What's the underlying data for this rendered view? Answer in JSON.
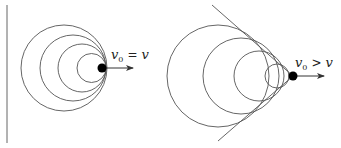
{
  "figure": {
    "left_panel": {
      "label": {
        "symbol": "v",
        "subscript": "0",
        "operator": "=",
        "rhs": "v"
      },
      "wall_line": {
        "x": 7,
        "y1": 5,
        "y2": 143
      },
      "source": {
        "cx": 102,
        "cy": 68,
        "r": 4.5
      },
      "velocity_arrow": {
        "x1": 106,
        "y1": 68,
        "x2": 133,
        "y2": 68
      },
      "wavefronts": [
        {
          "cx": 64,
          "cy": 68,
          "r": 43
        },
        {
          "cx": 73,
          "cy": 68,
          "r": 33
        },
        {
          "cx": 82,
          "cy": 68,
          "r": 24
        },
        {
          "cx": 91.5,
          "cy": 68,
          "r": 14.5
        }
      ]
    },
    "right_panel": {
      "label": {
        "symbol": "v",
        "subscript": "0",
        "operator": ">",
        "rhs": "v"
      },
      "source": {
        "cx": 293,
        "cy": 76,
        "r": 4.5
      },
      "velocity_arrow": {
        "x1": 297,
        "y1": 76,
        "x2": 324,
        "y2": 76
      },
      "mach_cone": {
        "upper": {
          "x1": 212,
          "y1": 5,
          "x2": 293,
          "y2": 76
        },
        "lower": {
          "x1": 218,
          "y1": 141,
          "x2": 293,
          "y2": 76
        }
      },
      "wavefronts": [
        {
          "cx": 218,
          "cy": 76,
          "r": 51
        },
        {
          "cx": 241,
          "cy": 76,
          "r": 38
        },
        {
          "cx": 259,
          "cy": 76,
          "r": 25
        },
        {
          "cx": 277,
          "cy": 76,
          "r": 12
        }
      ]
    },
    "colors": {
      "stroke": "#555555",
      "source_fill": "#000000",
      "text": "#222222",
      "background": "#ffffff"
    }
  }
}
